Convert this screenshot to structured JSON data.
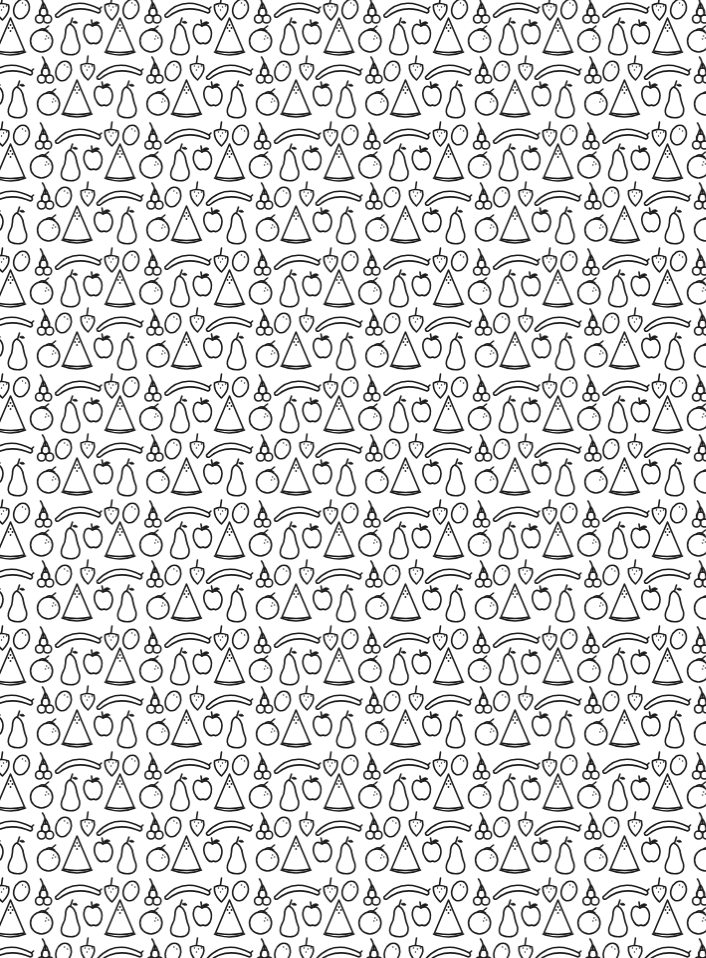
{
  "image": {
    "kind": "seamless-pattern",
    "description": "Black line-art fruit pattern on white background",
    "width": 706,
    "height": 958,
    "background_color": "#ffffff",
    "ink_color": "#1a1a1a"
  },
  "pattern": {
    "tile_width": 109.5,
    "tile_height": 126,
    "rows": [
      {
        "name": "row-a",
        "origin": [
          -4.5,
          18
        ],
        "fruits": [
          "strawberry",
          "lemon",
          "cherries",
          "banana",
          "watermelon",
          "orange",
          "pear",
          "apple"
        ]
      },
      {
        "name": "row-b",
        "origin": [
          62,
          80
        ],
        "fruits": [
          "strawberry",
          "banana",
          "cherries",
          "lemon",
          "watermelon",
          "apple",
          "pear",
          "orange"
        ]
      }
    ],
    "fruit_types": [
      "watermelon",
      "orange",
      "pear",
      "apple",
      "banana",
      "cherries",
      "lemon",
      "strawberry"
    ]
  }
}
